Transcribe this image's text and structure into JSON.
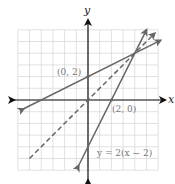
{
  "chart_data": {
    "type": "line",
    "title": "",
    "xlabel": "x",
    "ylabel": "y",
    "xlim": [
      -6,
      6
    ],
    "ylim": [
      -6,
      6
    ],
    "grid": true,
    "series": [
      {
        "name": "line through (0, 2)",
        "style": "solid",
        "x": [
          -5.5,
          6.2
        ],
        "y": [
          -0.75,
          5.1
        ]
      },
      {
        "name": "y = 2(x − 2)",
        "style": "solid",
        "x": [
          -0.8,
          5.0
        ],
        "y": [
          -5.6,
          6.0
        ]
      },
      {
        "name": "y = x",
        "style": "dashed",
        "x": [
          -5.0,
          5.7
        ],
        "y": [
          -5.0,
          5.7
        ]
      }
    ],
    "points": [
      {
        "label": "(0, 2)",
        "x": 0,
        "y": 2
      },
      {
        "label": "(2, 0)",
        "x": 2,
        "y": 0
      }
    ],
    "annotations": [
      "y = 2(x − 2)"
    ]
  },
  "labels": {
    "x_axis": "x",
    "y_axis": "y",
    "point_a": "(0, 2)",
    "point_b": "(2, 0)",
    "equation": "y = 2(x − 2)"
  },
  "colors": {
    "line": "#666666",
    "grid": "#d9d9d9",
    "axis": "#111111"
  }
}
